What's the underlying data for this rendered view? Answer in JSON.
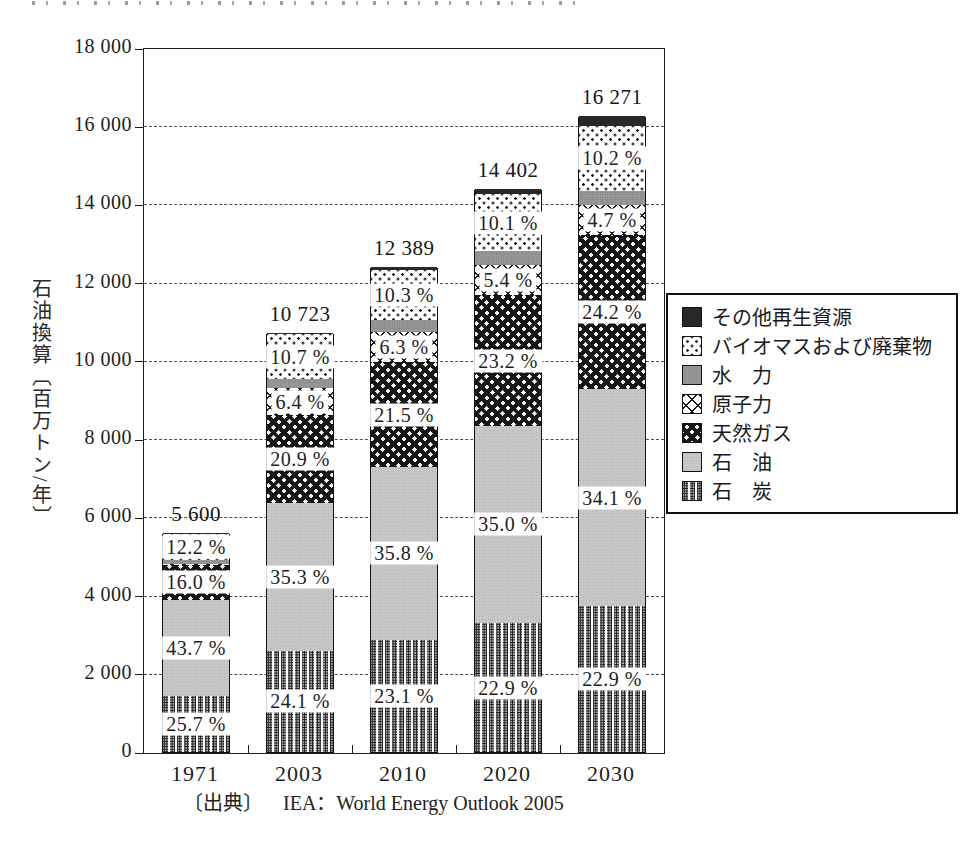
{
  "figure": {
    "y_axis_title": "石油換算〔百万トン/年〕",
    "source_label": "〔出典〕",
    "source_text": "IEA：World Energy Outlook 2005"
  },
  "chart_data": {
    "type": "bar",
    "subtype": "stacked-percent-labeled",
    "categories": [
      "1971",
      "2003",
      "2010",
      "2020",
      "2030"
    ],
    "totals": [
      5600,
      10723,
      12389,
      14402,
      16271
    ],
    "total_labels": [
      "5 600",
      "10 723",
      "12 389",
      "14 402",
      "16 271"
    ],
    "ylim": [
      0,
      18000
    ],
    "y_tick_step": 2000,
    "y_tick_labels": [
      "0",
      "2 000",
      "4 000",
      "6 000",
      "8 000",
      "10 000",
      "12 000",
      "14 000",
      "16 000",
      "18 000"
    ],
    "ylabel": "石油換算〔百万トン/年〕",
    "xlabel": "",
    "grid": "dashed-horizontal",
    "series": [
      {
        "name": "石　炭",
        "key": "coal",
        "values_pct": [
          25.7,
          24.1,
          23.1,
          22.9,
          22.9
        ],
        "labels": [
          "25.7 %",
          "24.1 %",
          "23.1 %",
          "22.9 %",
          "22.9 %"
        ]
      },
      {
        "name": "石　油",
        "key": "oil",
        "values_pct": [
          43.7,
          35.3,
          35.8,
          35.0,
          34.1
        ],
        "labels": [
          "43.7 %",
          "35.3 %",
          "35.8 %",
          "35.0 %",
          "34.1 %"
        ]
      },
      {
        "name": "天然ガス",
        "key": "gas",
        "values_pct": [
          16.0,
          20.9,
          21.5,
          23.2,
          24.2
        ],
        "labels": [
          "16.0 %",
          "20.9 %",
          "21.5 %",
          "23.2 %",
          "24.2 %"
        ]
      },
      {
        "name": "原子力",
        "key": "nuclear",
        "values_pct": [
          0.5,
          6.4,
          6.3,
          5.4,
          4.7
        ],
        "labels": [
          null,
          "6.4 %",
          "6.3 %",
          "5.4 %",
          "4.7 %"
        ]
      },
      {
        "name": "水　力",
        "key": "hydro",
        "values_pct": [
          1.8,
          2.2,
          2.4,
          2.4,
          2.3
        ],
        "labels": [
          null,
          null,
          null,
          null,
          null
        ]
      },
      {
        "name": "バイオマスおよび廃棄物",
        "key": "biomass",
        "values_pct": [
          12.2,
          10.7,
          10.3,
          10.1,
          10.2
        ],
        "labels": [
          "12.2 %",
          "10.7 %",
          "10.3 %",
          "10.1 %",
          "10.2 %"
        ]
      },
      {
        "name": "その他再生資源",
        "key": "other",
        "values_pct": [
          0.1,
          0.4,
          0.6,
          1.0,
          1.6
        ],
        "labels": [
          null,
          null,
          null,
          null,
          null
        ]
      }
    ],
    "legend": {
      "position": "right",
      "items": [
        {
          "label": "その他再生資源",
          "key": "other"
        },
        {
          "label": "バイオマスおよび廃棄物",
          "key": "biomass"
        },
        {
          "label": "水　力",
          "key": "hydro"
        },
        {
          "label": "原子力",
          "key": "nuclear"
        },
        {
          "label": "天然ガス",
          "key": "gas"
        },
        {
          "label": "石　油",
          "key": "oil"
        },
        {
          "label": "石　炭",
          "key": "coal"
        }
      ]
    }
  }
}
